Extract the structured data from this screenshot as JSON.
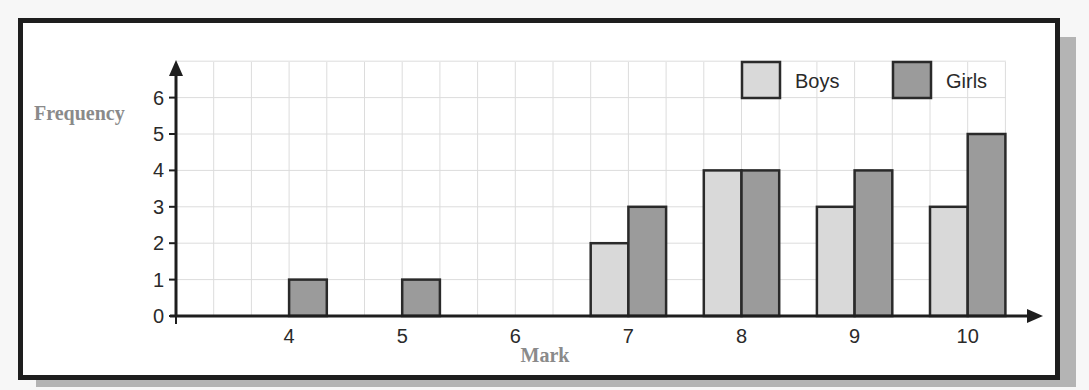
{
  "chart_data": {
    "type": "bar",
    "title": "",
    "xlabel": "Mark",
    "ylabel": "Frequency",
    "categories": [
      "4",
      "5",
      "6",
      "7",
      "8",
      "9",
      "10"
    ],
    "series": [
      {
        "name": "Boys",
        "color": "#d9d9d9",
        "values": [
          0,
          0,
          0,
          2,
          4,
          3,
          3
        ]
      },
      {
        "name": "Girls",
        "color": "#9b9b9b",
        "values": [
          1,
          1,
          0,
          3,
          4,
          4,
          5
        ]
      }
    ],
    "yticks": [
      "0",
      "1",
      "2",
      "3",
      "4",
      "5",
      "6"
    ],
    "ylim": [
      0,
      7
    ],
    "grid": true,
    "legend_position": "top-right"
  },
  "legend": {
    "boys": "Boys",
    "girls": "Girls"
  },
  "axes": {
    "x_label": "Mark",
    "y_label": "Frequency"
  }
}
